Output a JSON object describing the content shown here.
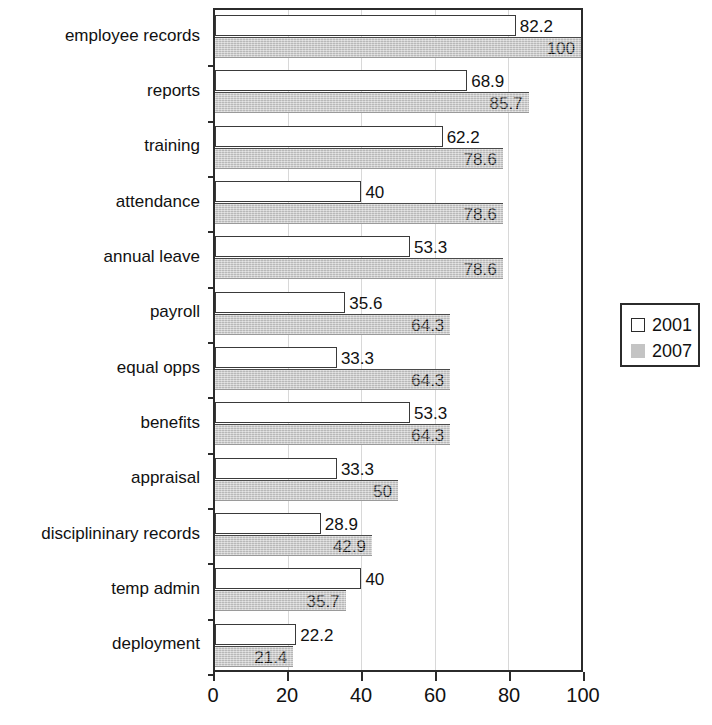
{
  "chart_data": {
    "type": "bar",
    "orientation": "horizontal",
    "title": "",
    "xlabel": "",
    "ylabel": "",
    "xlim": [
      0,
      100
    ],
    "xticks": [
      0,
      20,
      40,
      60,
      80,
      100
    ],
    "grid": true,
    "legend_position": "right",
    "categories": [
      "employee records",
      "reports",
      "training",
      "attendance",
      "annual leave",
      "payroll",
      "equal opps",
      "benefits",
      "appraisal",
      "disciplininary records",
      "temp admin",
      "deployment"
    ],
    "series": [
      {
        "name": "2001",
        "color": "#ffffff",
        "values": [
          82.2,
          68.9,
          62.2,
          40,
          53.3,
          35.6,
          33.3,
          53.3,
          33.3,
          28.9,
          40,
          22.2
        ],
        "labels": [
          "82.2",
          "68.9",
          "62.2",
          "40",
          "53.3",
          "35.6",
          "33.3",
          "53.3",
          "33.3",
          "28.9",
          "40",
          "22.2"
        ],
        "label_placement": "outside"
      },
      {
        "name": "2007",
        "color": "#c9c9c9",
        "values": [
          100,
          85.7,
          78.6,
          78.6,
          78.6,
          64.3,
          64.3,
          64.3,
          50,
          42.9,
          35.7,
          21.4
        ],
        "labels": [
          "100",
          "85.7",
          "78.6",
          "78.6",
          "78.6",
          "64.3",
          "64.3",
          "64.3",
          "50",
          "42.9",
          "35.7",
          "21.4"
        ],
        "label_placement": "inside"
      }
    ]
  },
  "legend": {
    "entries": [
      {
        "label": "2001",
        "swatch": "white-outlined-square"
      },
      {
        "label": "2007",
        "swatch": "grey-filled-square"
      }
    ]
  },
  "colors": {
    "series_2001_fill": "#ffffff",
    "series_2001_stroke": "#3a3a3a",
    "series_2007_fill": "#c9c9c9",
    "axis": "#2b2b2b",
    "gridline": "#d8d8d8",
    "text": "#111111",
    "background": "#ffffff"
  }
}
